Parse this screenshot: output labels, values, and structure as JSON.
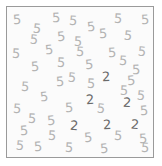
{
  "stimulus": {
    "type": "visual-search-array",
    "title": "Visual search array",
    "width": 162,
    "height": 166,
    "background_color": "#ffffff",
    "field": {
      "background_color": "#fbfbfb",
      "border_color": "#9a9a9a",
      "left": 6,
      "top": 6,
      "width": 148,
      "height": 152
    },
    "distractor": {
      "character": "5",
      "color": "#b3b3b3",
      "count": 45
    },
    "target": {
      "character": "2",
      "color": "#6a6a6a",
      "count": 6
    },
    "items": [
      {
        "char": "5",
        "role": "distractor",
        "x": 12,
        "y": 12,
        "rot": -4
      },
      {
        "char": "5",
        "role": "distractor",
        "x": 32,
        "y": 21,
        "rot": 6
      },
      {
        "char": "5",
        "role": "distractor",
        "x": 51,
        "y": 10,
        "rot": -2
      },
      {
        "char": "5",
        "role": "distractor",
        "x": 68,
        "y": 13,
        "rot": 4
      },
      {
        "char": "5",
        "role": "distractor",
        "x": 86,
        "y": 19,
        "rot": -6
      },
      {
        "char": "5",
        "role": "distractor",
        "x": 113,
        "y": 11,
        "rot": 3
      },
      {
        "char": "5",
        "role": "distractor",
        "x": 140,
        "y": 12,
        "rot": -3
      },
      {
        "char": "5",
        "role": "distractor",
        "x": 29,
        "y": 32,
        "rot": 5
      },
      {
        "char": "5",
        "role": "distractor",
        "x": 56,
        "y": 29,
        "rot": -5
      },
      {
        "char": "5",
        "role": "distractor",
        "x": 73,
        "y": 34,
        "rot": 2
      },
      {
        "char": "5",
        "role": "distractor",
        "x": 98,
        "y": 26,
        "rot": -4
      },
      {
        "char": "5",
        "role": "distractor",
        "x": 123,
        "y": 28,
        "rot": 6
      },
      {
        "char": "5",
        "role": "distractor",
        "x": 11,
        "y": 46,
        "rot": 3
      },
      {
        "char": "5",
        "role": "distractor",
        "x": 44,
        "y": 42,
        "rot": -6
      },
      {
        "char": "5",
        "role": "distractor",
        "x": 75,
        "y": 44,
        "rot": 4
      },
      {
        "char": "5",
        "role": "distractor",
        "x": 107,
        "y": 45,
        "rot": -3
      },
      {
        "char": "5",
        "role": "distractor",
        "x": 137,
        "y": 44,
        "rot": 5
      },
      {
        "char": "5",
        "role": "distractor",
        "x": 30,
        "y": 59,
        "rot": -4
      },
      {
        "char": "5",
        "role": "distractor",
        "x": 56,
        "y": 55,
        "rot": 3
      },
      {
        "char": "5",
        "role": "distractor",
        "x": 84,
        "y": 57,
        "rot": -5
      },
      {
        "char": "5",
        "role": "distractor",
        "x": 118,
        "y": 53,
        "rot": 4
      },
      {
        "char": "5",
        "role": "distractor",
        "x": 131,
        "y": 62,
        "rot": -2
      },
      {
        "char": "5",
        "role": "distractor",
        "x": 67,
        "y": 70,
        "rot": 5
      },
      {
        "char": "2",
        "role": "target",
        "x": 101,
        "y": 69,
        "rot": -3
      },
      {
        "char": "5",
        "role": "distractor",
        "x": 55,
        "y": 74,
        "rot": -4
      },
      {
        "char": "5",
        "role": "distractor",
        "x": 86,
        "y": 76,
        "rot": 3
      },
      {
        "char": "5",
        "role": "distractor",
        "x": 126,
        "y": 73,
        "rot": -5
      },
      {
        "char": "5",
        "role": "distractor",
        "x": 20,
        "y": 79,
        "rot": 4
      },
      {
        "char": "5",
        "role": "distractor",
        "x": 119,
        "y": 83,
        "rot": 2
      },
      {
        "char": "5",
        "role": "distractor",
        "x": 39,
        "y": 89,
        "rot": -6
      },
      {
        "char": "5",
        "role": "distractor",
        "x": 136,
        "y": 88,
        "rot": 5
      },
      {
        "char": "2",
        "role": "target",
        "x": 85,
        "y": 92,
        "rot": -4
      },
      {
        "char": "2",
        "role": "target",
        "x": 122,
        "y": 95,
        "rot": 3
      },
      {
        "char": "5",
        "role": "distractor",
        "x": 12,
        "y": 101,
        "rot": 4
      },
      {
        "char": "5",
        "role": "distractor",
        "x": 64,
        "y": 100,
        "rot": -3
      },
      {
        "char": "5",
        "role": "distractor",
        "x": 96,
        "y": 101,
        "rot": 5
      },
      {
        "char": "5",
        "role": "distractor",
        "x": 139,
        "y": 103,
        "rot": -4
      },
      {
        "char": "5",
        "role": "distractor",
        "x": 27,
        "y": 111,
        "rot": 3
      },
      {
        "char": "5",
        "role": "distractor",
        "x": 46,
        "y": 113,
        "rot": -5
      },
      {
        "char": "2",
        "role": "target",
        "x": 69,
        "y": 118,
        "rot": 4
      },
      {
        "char": "2",
        "role": "target",
        "x": 102,
        "y": 117,
        "rot": -3
      },
      {
        "char": "2",
        "role": "target",
        "x": 130,
        "y": 117,
        "rot": 5
      },
      {
        "char": "5",
        "role": "distractor",
        "x": 19,
        "y": 123,
        "rot": -4
      },
      {
        "char": "5",
        "role": "distractor",
        "x": 47,
        "y": 128,
        "rot": 3
      },
      {
        "char": "5",
        "role": "distractor",
        "x": 83,
        "y": 130,
        "rot": -5
      },
      {
        "char": "5",
        "role": "distractor",
        "x": 113,
        "y": 128,
        "rot": 4
      },
      {
        "char": "5",
        "role": "distractor",
        "x": 138,
        "y": 131,
        "rot": -3
      },
      {
        "char": "5",
        "role": "distractor",
        "x": 15,
        "y": 138,
        "rot": 5
      },
      {
        "char": "5",
        "role": "distractor",
        "x": 33,
        "y": 139,
        "rot": -4
      },
      {
        "char": "5",
        "role": "distractor",
        "x": 64,
        "y": 140,
        "rot": 3
      },
      {
        "char": "5",
        "role": "distractor",
        "x": 99,
        "y": 141,
        "rot": -5
      },
      {
        "char": "5",
        "role": "distractor",
        "x": 140,
        "y": 140,
        "rot": 4
      }
    ]
  }
}
